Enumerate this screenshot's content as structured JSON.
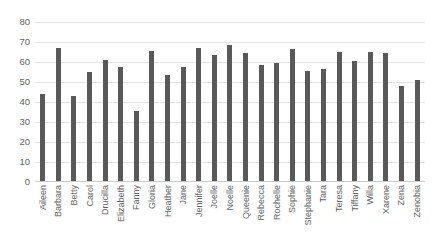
{
  "chart_data": {
    "type": "bar",
    "title": "",
    "xlabel": "",
    "ylabel": "",
    "ylim": [
      0,
      80
    ],
    "ytick_step": 10,
    "yticks": [
      80,
      70,
      60,
      50,
      40,
      30,
      20,
      10,
      0
    ],
    "grid": true,
    "legend": false,
    "bar_color": "#595959",
    "gridline_color": "#E3E3E3",
    "axis_color": "#C9C9C9",
    "text_color": "#5F5F5F",
    "background": "#FFFFFF",
    "categories": [
      "Aileen",
      "Barbara",
      "Betty",
      "Carol",
      "Drucilla",
      "Elizabeth",
      "Fanny",
      "Gloria",
      "Heather",
      "Jane",
      "Jennifer",
      "Joelle",
      "Noelle",
      "Queenie",
      "Rebecca",
      "Rochelle",
      "Sophie",
      "Stephanie",
      "Tara",
      "Teresa",
      "Tiffany",
      "Willa",
      "Xarene",
      "Zena",
      "Zenobia"
    ],
    "values": [
      44.0,
      67.0,
      43.0,
      55.0,
      61.0,
      57.5,
      35.5,
      65.5,
      53.5,
      57.5,
      67.0,
      63.5,
      68.7,
      64.5,
      58.5,
      59.5,
      66.5,
      55.5,
      56.5,
      65.0,
      60.5,
      65.0,
      64.5,
      48.0,
      51.0
    ]
  }
}
